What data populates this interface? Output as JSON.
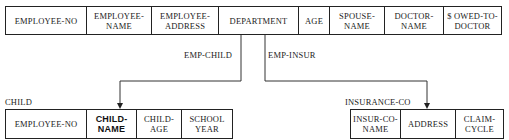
{
  "employee": {
    "fields": [
      {
        "label": "EMPLOYEE-NO",
        "w": 81
      },
      {
        "label": "EMPLOYEE-\nNAME",
        "w": 65
      },
      {
        "label": "EMPLOYEE-\nADDRESS",
        "w": 67
      },
      {
        "label": "DEPARTMENT",
        "w": 80
      },
      {
        "label": "AGE",
        "w": 31
      },
      {
        "label": "SPOUSE-\nNAME",
        "w": 55
      },
      {
        "label": "DOCTOR-\nNAME",
        "w": 59
      },
      {
        "label": "$ OWED-TO-\nDOCTOR",
        "w": 57
      }
    ]
  },
  "relationships": {
    "emp_child": "EMP-CHILD",
    "emp_insur": "EMP-INSUR"
  },
  "child": {
    "title": "CHILD",
    "fields": [
      {
        "label": "EMPLOYEE-NO",
        "w": 81,
        "key": false
      },
      {
        "label": "CHILD-\nNAME",
        "w": 50,
        "key": true
      },
      {
        "label": "CHILD-\nAGE",
        "w": 45,
        "key": false
      },
      {
        "label": "SCHOOL\nYEAR",
        "w": 50,
        "key": false
      }
    ]
  },
  "insurance": {
    "title": "INSURANCE-CO",
    "fields": [
      {
        "label": "INSUR-CO-\nNAME",
        "w": 50
      },
      {
        "label": "ADDRESS",
        "w": 55
      },
      {
        "label": "CLAIM-\nCYCLE",
        "w": 47
      }
    ]
  }
}
